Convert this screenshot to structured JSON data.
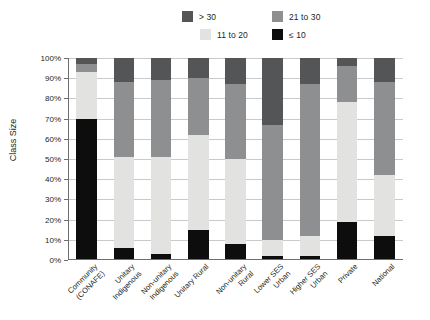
{
  "chart_data": {
    "type": "bar",
    "subtype": "stacked-100-percent",
    "title": "",
    "xlabel": "",
    "ylabel": "Class Size",
    "ylim": [
      0,
      100
    ],
    "y_unit": "%",
    "grid": true,
    "legend_position": "top",
    "categories": [
      "Community\n(CONAFE)",
      "Unitary\nIndigenous",
      "Non-unitary\nIndigenous",
      "Unitary Rural",
      "Non-unitary\nRural",
      "Lower SES\nUrban",
      "Higher SES\nUrban",
      "Private",
      "National"
    ],
    "tick_labels": [
      "0%",
      "10%",
      "20%",
      "30%",
      "40%",
      "50%",
      "60%",
      "70%",
      "80%",
      "90%",
      "100%"
    ],
    "tick_values": [
      0,
      10,
      20,
      30,
      40,
      50,
      60,
      70,
      80,
      90,
      100
    ],
    "series": [
      {
        "name": "≤ 10",
        "color": "#0d0d0d",
        "values": [
          70,
          6,
          3,
          15,
          8,
          2,
          2,
          19,
          12
        ]
      },
      {
        "name": "11 to 20",
        "color": "#e2e2e0",
        "values": [
          23,
          45,
          48,
          47,
          42,
          8,
          10,
          59,
          30
        ]
      },
      {
        "name": "21 to 30",
        "color": "#8e8f91",
        "values": [
          4,
          37,
          38,
          28,
          37,
          57,
          75,
          18,
          46
        ]
      },
      {
        "name": "> 30",
        "color": "#545557",
        "values": [
          3,
          12,
          11,
          10,
          13,
          33,
          13,
          4,
          12
        ]
      }
    ],
    "legend": [
      {
        "label": "> 30",
        "color": "#545557"
      },
      {
        "label": "21 to 30",
        "color": "#8e8f91"
      },
      {
        "label": "11 to 20",
        "color": "#e2e2e0"
      },
      {
        "label": "≤ 10",
        "color": "#0d0d0d"
      }
    ]
  }
}
